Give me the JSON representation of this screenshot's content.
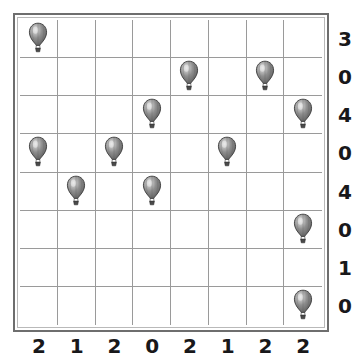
{
  "puzzle": {
    "title": "Balloon Grid Puzzle",
    "type": "balloon-placement-grid",
    "grid": {
      "rows": 8,
      "columns": 8,
      "cell_size_px": 38,
      "line_color": "#9a9a9a",
      "frame_color": "#6e6e6e",
      "background_color": "#ffffff"
    },
    "icon": {
      "name": "hot-air-balloon-icon",
      "envelope_color": "#8e8e8e",
      "outline_color": "#3a3a3a",
      "basket_color": "#4a4a4a"
    },
    "row_clues": [
      "3",
      "0",
      "4",
      "0",
      "4",
      "0",
      "1",
      "0"
    ],
    "column_clues": [
      "2",
      "1",
      "2",
      "0",
      "2",
      "1",
      "2",
      "2"
    ],
    "balloon_count": 12,
    "balloon_cells": [
      {
        "row": 1,
        "col": 1
      },
      {
        "row": 2,
        "col": 5
      },
      {
        "row": 2,
        "col": 7
      },
      {
        "row": 3,
        "col": 4
      },
      {
        "row": 3,
        "col": 8
      },
      {
        "row": 4,
        "col": 1
      },
      {
        "row": 4,
        "col": 3
      },
      {
        "row": 4,
        "col": 6
      },
      {
        "row": 5,
        "col": 2
      },
      {
        "row": 5,
        "col": 4
      },
      {
        "row": 6,
        "col": 8
      },
      {
        "row": 8,
        "col": 8
      }
    ],
    "grid_matrix": [
      [
        1,
        0,
        0,
        0,
        0,
        0,
        0,
        0
      ],
      [
        0,
        0,
        0,
        0,
        1,
        0,
        1,
        0
      ],
      [
        0,
        0,
        0,
        1,
        0,
        0,
        0,
        1
      ],
      [
        1,
        0,
        1,
        0,
        0,
        1,
        0,
        0
      ],
      [
        0,
        1,
        0,
        1,
        0,
        0,
        0,
        0
      ],
      [
        0,
        0,
        0,
        0,
        0,
        0,
        0,
        1
      ],
      [
        0,
        0,
        0,
        0,
        0,
        0,
        0,
        0
      ],
      [
        0,
        0,
        0,
        0,
        0,
        0,
        0,
        1
      ]
    ]
  }
}
